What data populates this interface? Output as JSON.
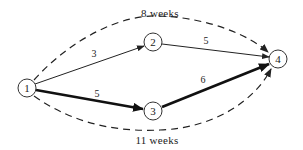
{
  "nodes": [
    {
      "id": "1",
      "label": "1",
      "cx": 27,
      "cy": 88
    },
    {
      "id": "2",
      "label": "2",
      "cx": 153,
      "cy": 42
    },
    {
      "id": "3",
      "label": "3",
      "cx": 153,
      "cy": 111
    },
    {
      "id": "4",
      "label": "4",
      "cx": 278,
      "cy": 59
    }
  ],
  "edges": [
    {
      "from": "1",
      "to": "2",
      "label": "3",
      "style": "thin"
    },
    {
      "from": "2",
      "to": "4",
      "label": "5",
      "style": "thin"
    },
    {
      "from": "1",
      "to": "3",
      "label": "5",
      "style": "thick"
    },
    {
      "from": "3",
      "to": "4",
      "label": "6",
      "style": "thick"
    }
  ],
  "paths": {
    "upper": {
      "label": "8 weeks",
      "route": [
        "1",
        "2",
        "4"
      ],
      "style": "dashed"
    },
    "lower": {
      "label": "11 weeks",
      "route": [
        "1",
        "3",
        "4"
      ],
      "style": "dashed",
      "critical": true
    }
  }
}
